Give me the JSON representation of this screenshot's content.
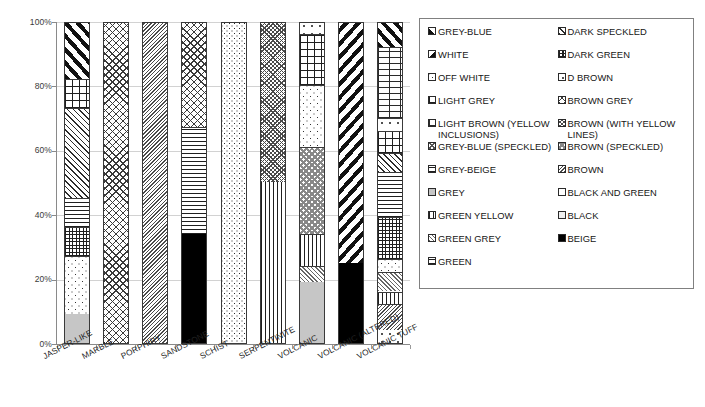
{
  "chart_data": {
    "type": "bar",
    "subtype": "stacked-100-percent",
    "title": "",
    "xlabel": "",
    "ylabel": "",
    "ylim": [
      0,
      100
    ],
    "ytick_labels": [
      "0%",
      "20%",
      "40%",
      "60%",
      "80%",
      "100%"
    ],
    "ytick_values": [
      0,
      20,
      40,
      60,
      80,
      100
    ],
    "grid": true,
    "legend_position": "right",
    "categories": [
      "JASPER-LIKE",
      "MARBLE",
      "PORPHIRY",
      "SANDSTONE",
      "SCHIST",
      "SERPENTINITE",
      "VOLCANIC",
      "VOLCANIC (ALTERED)",
      "VOLCANIC TUFF"
    ],
    "bars": [
      {
        "category": "JASPER-LIKE",
        "segments": [
          {
            "label": "GREY",
            "value": 9,
            "pattern": "p-solid-grey"
          },
          {
            "label": "OFF WHITE",
            "value": 18,
            "pattern": "p-speckle"
          },
          {
            "label": "DARK GREEN",
            "value": 9,
            "pattern": "p-grid-small"
          },
          {
            "label": "GREY-BEIGE",
            "value": 9,
            "pattern": "p-horiz"
          },
          {
            "label": "GREY-BLUE (SPECKLED)",
            "value": 28,
            "pattern": "p-diag-up-thin"
          },
          {
            "label": "LIGHT GREY",
            "value": 9,
            "pattern": "p-grid"
          },
          {
            "label": "GREY-BLUE",
            "value": 18,
            "pattern": "p-diag-up-bold"
          }
        ]
      },
      {
        "category": "MARBLE",
        "segments": [
          {
            "label": "BROWN GREY",
            "value": 100,
            "pattern": "p-crosshatch-diag"
          }
        ]
      },
      {
        "category": "PORPHIRY",
        "segments": [
          {
            "label": "BROWN",
            "value": 100,
            "pattern": "p-diag-down-dense"
          }
        ]
      },
      {
        "category": "SANDSTONE",
        "segments": [
          {
            "label": "BEIGE",
            "value": 34,
            "pattern": "p-solid-black"
          },
          {
            "label": "GREY-BEIGE",
            "value": 33,
            "pattern": "p-horiz"
          },
          {
            "label": "BROWN GREY",
            "value": 33,
            "pattern": "p-crosshatch-diag"
          }
        ]
      },
      {
        "category": "SCHIST",
        "segments": [
          {
            "label": "OFF WHITE",
            "value": 100,
            "pattern": "p-speckle-dense"
          }
        ]
      },
      {
        "category": "SERPENTINITE",
        "segments": [
          {
            "label": "GREEN YELLOW",
            "value": 50,
            "pattern": "p-vert"
          },
          {
            "label": "GREEN GREY",
            "value": 50,
            "pattern": "p-crosshatch-fine"
          }
        ]
      },
      {
        "category": "VOLCANIC",
        "segments": [
          {
            "label": "GREY",
            "value": 19,
            "pattern": "p-solid-grey"
          },
          {
            "label": "GREEN GREY",
            "value": 5,
            "pattern": "p-trellis"
          },
          {
            "label": "GREEN YELLOW",
            "value": 10,
            "pattern": "p-vert"
          },
          {
            "label": "BROWN (SPECKLED)",
            "value": 27,
            "pattern": "p-checker"
          },
          {
            "label": "OFF WHITE",
            "value": 19,
            "pattern": "p-speckle"
          },
          {
            "label": "LIGHT GREY",
            "value": 16,
            "pattern": "p-grid"
          },
          {
            "label": "D BROWN",
            "value": 4,
            "pattern": "p-speckle-light"
          }
        ]
      },
      {
        "category": "VOLCANIC (ALTERED)",
        "segments": [
          {
            "label": "BEIGE",
            "value": 25,
            "pattern": "p-solid-black"
          },
          {
            "label": "GREY-BLUE",
            "value": 75,
            "pattern": "p-diag-down-bold"
          }
        ]
      },
      {
        "category": "VOLCANIC TUFF",
        "segments": [
          {
            "label": "D BROWN",
            "value": 4,
            "pattern": "p-speckle-light"
          },
          {
            "label": "BROWN",
            "value": 8,
            "pattern": "p-diag-down-dense"
          },
          {
            "label": "GREEN YELLOW",
            "value": 4,
            "pattern": "p-vert"
          },
          {
            "label": "GREEN GREY",
            "value": 6,
            "pattern": "p-trellis"
          },
          {
            "label": "OFF WHITE",
            "value": 4,
            "pattern": "p-speckle"
          },
          {
            "label": "DARK GREEN",
            "value": 13,
            "pattern": "p-grid-small"
          },
          {
            "label": "GREY-BEIGE",
            "value": 14,
            "pattern": "p-horiz"
          },
          {
            "label": "GREY-BLUE (SPECKLED)",
            "value": 6,
            "pattern": "p-diag-up-thin"
          },
          {
            "label": "LIGHT GREY",
            "value": 7,
            "pattern": "p-grid"
          },
          {
            "label": "LIGHT BROWN (YELLOW INCLUSIONS)",
            "value": 4,
            "pattern": "p-speckle-light"
          },
          {
            "label": "BROWN (WITH YELLOW LINES)",
            "value": 22,
            "pattern": "p-brick"
          },
          {
            "label": "GREY-BLUE",
            "value": 8,
            "pattern": "p-diag-up-bold"
          }
        ]
      }
    ],
    "legend": {
      "rows": [
        [
          {
            "label": "GREY-BLUE",
            "pattern": "p-diag-up-bold"
          },
          {
            "label": "DARK SPECKLED",
            "pattern": "p-diag-up-thin"
          }
        ],
        [
          {
            "label": "WHITE",
            "pattern": "p-diag-down-bold"
          },
          {
            "label": "DARK GREEN",
            "pattern": "p-grid-small"
          }
        ],
        [
          {
            "label": "OFF WHITE",
            "pattern": "p-speckle"
          },
          {
            "label": "D BROWN",
            "pattern": "p-speckle-light"
          }
        ],
        [
          {
            "label": "LIGHT GREY",
            "pattern": "p-grid"
          },
          {
            "label": "BROWN GREY",
            "pattern": "p-crosshatch-diag"
          }
        ],
        [
          {
            "label": "LIGHT BROWN (YELLOW INCLUSIONS)",
            "pattern": "p-brick"
          },
          {
            "label": "BROWN (WITH YELLOW LINES)",
            "pattern": "p-crosshatch-fine"
          }
        ],
        [
          {
            "label": "GREY-BLUE (SPECKLED)",
            "pattern": "p-weave"
          },
          {
            "label": "BROWN (SPECKLED)",
            "pattern": "p-checker"
          }
        ],
        [
          {
            "label": "GREY-BEIGE",
            "pattern": "p-horiz"
          },
          {
            "label": "BROWN",
            "pattern": "p-diag-down-dense"
          }
        ],
        [
          {
            "label": "GREY",
            "pattern": "p-solid-grey"
          },
          {
            "label": "BLACK AND GREEN",
            "pattern": "p-white"
          }
        ],
        [
          {
            "label": "GREEN YELLOW",
            "pattern": "p-vert"
          },
          {
            "label": "BLACK",
            "pattern": "p-lightgrey"
          }
        ],
        [
          {
            "label": "GREEN GREY",
            "pattern": "p-trellis"
          },
          {
            "label": "BEIGE",
            "pattern": "p-solid-black"
          }
        ],
        [
          {
            "label": "GREEN",
            "pattern": "p-horiz"
          },
          {
            "label": "",
            "pattern": ""
          }
        ]
      ]
    }
  },
  "colors": {
    "axis": "#8a8a8a",
    "gridline": "#d2d2d2",
    "text": "#1b1b1b",
    "legend_border": "#808080",
    "solid_grey_fill": "#c6c6c6",
    "solid_black_fill": "#000000"
  }
}
